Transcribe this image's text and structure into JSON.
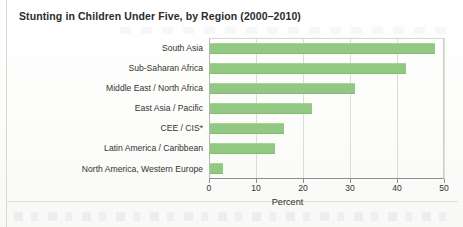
{
  "figure": {
    "title": "Stunting in Children Under Five, by Region (2000–2010)"
  },
  "chart_data": {
    "type": "bar",
    "orientation": "horizontal",
    "title": "Stunting in Children Under Five, by Region (2000–2010)",
    "xlabel": "Percent",
    "ylabel": "",
    "xlim": [
      0,
      50
    ],
    "xticks": [
      0,
      10,
      20,
      30,
      40,
      50
    ],
    "xtick_labels": [
      "0",
      "10",
      "20",
      "30",
      "40",
      "50"
    ],
    "grid": true,
    "grid_axis": "x",
    "legend": false,
    "bar_color": "#92c882",
    "categories": [
      "South Asia",
      "Sub-Saharan Africa",
      "Middle East / North Africa",
      "East Asia / Pacific",
      "CEE / CIS*",
      "Latin America / Caribbean",
      "North America, Western Europe"
    ],
    "values": [
      48,
      42,
      31,
      22,
      16,
      14,
      3
    ],
    "footnote_marker": "*"
  }
}
